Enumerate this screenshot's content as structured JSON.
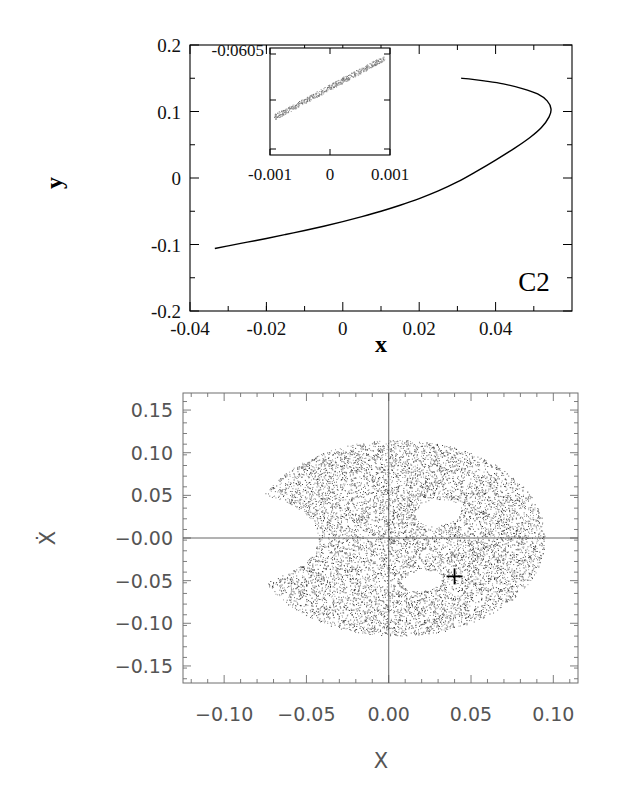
{
  "figure": {
    "background": "#ffffff",
    "width": 633,
    "height": 789
  },
  "panels": [
    {
      "id": "top-panel",
      "corner_tag": "C2",
      "chart_data": {
        "type": "line",
        "title": "",
        "xlabel": "x",
        "ylabel": "y",
        "xlim": [
          -0.04,
          0.06
        ],
        "ylim": [
          -0.2,
          0.2
        ],
        "xticks": [
          -0.04,
          -0.02,
          0,
          0.02,
          0.04
        ],
        "xticklabels": [
          "-0.04",
          "-0.02",
          "0",
          "0.02",
          "0.04"
        ],
        "yticks": [
          -0.2,
          -0.1,
          0,
          0.1,
          0.2
        ],
        "yticklabels": [
          "-0.2",
          "-0.1",
          "0",
          "0.1",
          "0.2"
        ],
        "minor_ticks": true,
        "grid": false,
        "legend": "none",
        "series": [
          {
            "name": "C2 family curve",
            "description": "left-opening parabolic branch, turning point near x=0.054",
            "x": [
              -0.0335,
              -0.03,
              -0.025,
              -0.02,
              -0.015,
              -0.01,
              -0.005,
              0.0,
              0.005,
              0.01,
              0.015,
              0.02,
              0.025,
              0.03,
              0.035,
              0.04,
              0.045,
              0.049,
              0.052,
              0.054,
              0.0545,
              0.0535,
              0.051,
              0.047,
              0.042,
              0.037,
              0.033,
              0.031
            ],
            "y": [
              -0.106,
              -0.102,
              -0.0965,
              -0.091,
              -0.085,
              -0.079,
              -0.0725,
              -0.0655,
              -0.058,
              -0.05,
              -0.041,
              -0.031,
              -0.0195,
              -0.006,
              0.01,
              0.027,
              0.045,
              0.061,
              0.076,
              0.092,
              0.104,
              0.116,
              0.1265,
              0.1345,
              0.1415,
              0.146,
              0.149,
              0.15
            ]
          }
        ]
      },
      "inset": {
        "chart_data": {
          "type": "scatter",
          "title": "",
          "xlabel": "",
          "ylabel": "",
          "xlim": [
            -0.0015,
            0.0015
          ],
          "ylim": [
            -0.06065,
            -0.0604
          ],
          "xticks": [
            -0.001,
            0,
            0.001
          ],
          "xticklabels": [
            "-0.001",
            "0",
            "0.001"
          ],
          "yticks": [
            -0.0605
          ],
          "yticklabels": [
            "-0.0605"
          ],
          "grid": false,
          "description": "narrow speckled band rising from lower-left to upper-right"
        }
      }
    },
    {
      "id": "bottom-panel",
      "chart_data": {
        "type": "scatter",
        "title": "",
        "xlabel": "X",
        "ylabel": "Ẋ",
        "xlim": [
          -0.125,
          0.115
        ],
        "ylim": [
          -0.17,
          0.17
        ],
        "xticks": [
          -0.1,
          -0.05,
          0.0,
          0.05,
          0.1
        ],
        "xticklabels": [
          "−0.10",
          "−0.05",
          "0.00",
          "0.05",
          "0.10"
        ],
        "yticks": [
          0.15,
          0.1,
          0.05,
          -0.0,
          -0.05,
          -0.1,
          -0.15
        ],
        "yticklabels": [
          "0.15",
          "0.10",
          "0.05",
          "−0.00",
          "−0.05",
          "−0.10",
          "−0.15"
        ],
        "minor_ticks": true,
        "grid": false,
        "legend": "none",
        "description": "Poincare surface of section: dense chaotic crescent (kidney / Pac-Man) shaped cloud opening toward negative X, with two small empty islands and a cross marker",
        "point_count_approx": 9000,
        "cloud": {
          "outer_center": [
            0.005,
            0.0
          ],
          "outer_rx": 0.09,
          "outer_ry": 0.115,
          "notch_center": [
            -0.098,
            0.0
          ],
          "notch_rx": 0.055,
          "notch_ry": 0.055
        },
        "islands": [
          {
            "center": [
              0.03,
              0.03
            ],
            "rx": 0.013,
            "ry": 0.016,
            "angle_deg": -35
          },
          {
            "center": [
              0.02,
              -0.05
            ],
            "rx": 0.011,
            "ry": 0.013,
            "angle_deg": -35
          }
        ],
        "markers": [
          {
            "symbol": "+",
            "x": 0.04,
            "y": -0.045,
            "label": ""
          }
        ]
      }
    }
  ]
}
